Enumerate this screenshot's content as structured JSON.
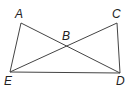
{
  "diagram": {
    "points": [
      {
        "label": "A",
        "x": 21,
        "y": 23,
        "lx": 15,
        "ly": 18
      },
      {
        "label": "C",
        "x": 117,
        "y": 23,
        "lx": 112,
        "ly": 18
      },
      {
        "label": "B",
        "x": 66,
        "y": 46,
        "lx": 62,
        "ly": 40
      },
      {
        "label": "E",
        "x": 10,
        "y": 72,
        "lx": 4,
        "ly": 85
      },
      {
        "label": "D",
        "x": 120,
        "y": 73,
        "lx": 116,
        "ly": 85
      }
    ],
    "segments": [
      [
        "A",
        "E"
      ],
      [
        "A",
        "D"
      ],
      [
        "C",
        "E"
      ],
      [
        "C",
        "D"
      ],
      [
        "E",
        "D"
      ]
    ]
  }
}
